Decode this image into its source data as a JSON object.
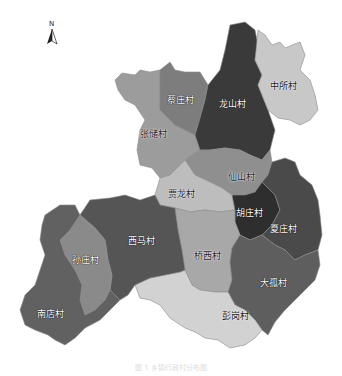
{
  "north_arrow": {
    "label": "N"
  },
  "map": {
    "regions": [
      {
        "name": "蔡庄村",
        "color": "#7d7d7d",
        "x": 180,
        "y": 100,
        "style": "light"
      },
      {
        "name": "龙山村",
        "color": "#3a3a3a",
        "x": 232,
        "y": 104,
        "style": "light"
      },
      {
        "name": "中所村",
        "color": "#c8c8c8",
        "x": 283,
        "y": 86,
        "style": "dark"
      },
      {
        "name": "张储村",
        "color": "#9c9c9c",
        "x": 153,
        "y": 134,
        "style": "dark"
      },
      {
        "name": "仙山村",
        "color": "#8f8f8f",
        "x": 241,
        "y": 177,
        "style": "dark"
      },
      {
        "name": "贾龙村",
        "color": "#bdbdbd",
        "x": 181,
        "y": 194,
        "style": "dark"
      },
      {
        "name": "胡庄村",
        "color": "#2e2e2e",
        "x": 249,
        "y": 213,
        "style": "light"
      },
      {
        "name": "夏庄村",
        "color": "#4a4a4a",
        "x": 283,
        "y": 229,
        "style": "light"
      },
      {
        "name": "西马村",
        "color": "#555555",
        "x": 141,
        "y": 241,
        "style": "light"
      },
      {
        "name": "孙庄村",
        "color": "#8a8a8a",
        "x": 85,
        "y": 260,
        "style": "light"
      },
      {
        "name": "桥西村",
        "color": "#a8a8a8",
        "x": 207,
        "y": 256,
        "style": "dark"
      },
      {
        "name": "大孤村",
        "color": "#5e5e5e",
        "x": 273,
        "y": 283,
        "style": "light"
      },
      {
        "name": "彭岗村",
        "color": "#d2d2d2",
        "x": 235,
        "y": 316,
        "style": "dark"
      },
      {
        "name": "南店村",
        "color": "#616161",
        "x": 50,
        "y": 314,
        "style": "light"
      }
    ]
  },
  "caption": "图 1 乡镇行政村分布图"
}
